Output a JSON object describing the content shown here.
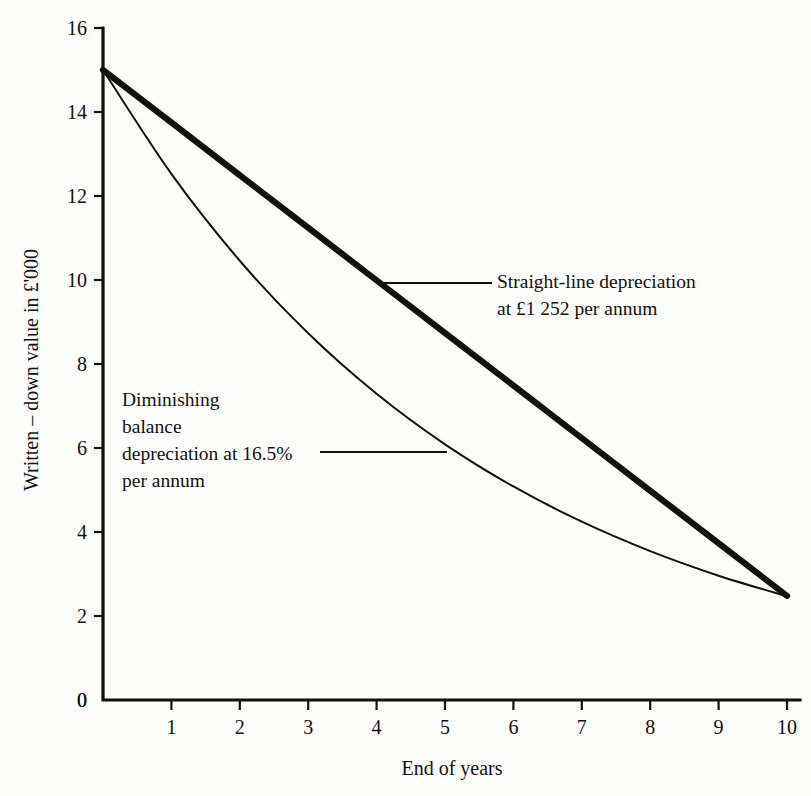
{
  "chart_data": {
    "type": "line",
    "title": "",
    "xlabel": "End of years",
    "ylabel": "Written – down value in £'000",
    "xlim": [
      0,
      10
    ],
    "ylim": [
      0,
      16
    ],
    "xticks": [
      "0",
      "1",
      "2",
      "3",
      "4",
      "5",
      "6",
      "7",
      "8",
      "9",
      "10"
    ],
    "yticks": [
      "0",
      "2",
      "4",
      "6",
      "8",
      "10",
      "12",
      "14",
      "16"
    ],
    "grid": false,
    "legend_position": "inline-annotations",
    "x": [
      0,
      1,
      2,
      3,
      4,
      5,
      6,
      7,
      8,
      9,
      10
    ],
    "series": [
      {
        "name": "Straight-line depreciation",
        "style": "thick-solid",
        "color": "#111111",
        "values": [
          15.0,
          13.748,
          12.496,
          11.244,
          9.992,
          8.74,
          7.488,
          6.236,
          4.984,
          3.732,
          2.48
        ]
      },
      {
        "name": "Diminishing balance depreciation",
        "style": "thin-solid",
        "color": "#111111",
        "values": [
          15.0,
          12.525,
          10.458,
          8.732,
          7.291,
          6.088,
          5.084,
          4.245,
          3.545,
          2.96,
          2.471
        ]
      }
    ],
    "annotations": [
      {
        "id": "straight-line-annotation",
        "lines": [
          "Straight-line depreciation",
          "at £1 252 per annum"
        ],
        "text_x": 497,
        "text_y": 288,
        "leader": {
          "x1": 377,
          "y1": 283,
          "x2": 492,
          "y2": 283
        }
      },
      {
        "id": "diminishing-balance-annotation",
        "lines": [
          "Diminishing",
          "balance",
          "depreciation at 16.5%",
          "per annum"
        ],
        "text_x": 122,
        "text_y": 406,
        "leader": {
          "x1": 320,
          "y1": 452,
          "x2": 447,
          "y2": 452
        }
      }
    ]
  },
  "axes": {
    "origin_label": "0",
    "x_axis_name": "End of years",
    "y_axis_name": "Written – down value in £'000"
  },
  "geometry": {
    "x0_px": 103,
    "x10_px": 787,
    "y0_px": 700,
    "y16_px": 28
  }
}
